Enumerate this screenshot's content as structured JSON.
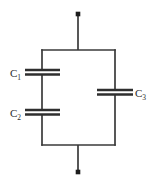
{
  "diagram": {
    "canvas": {
      "width": 156,
      "height": 186,
      "background": "#ffffff"
    },
    "style": {
      "line_color": "#3a3a3a",
      "plate_color": "#2e2e2e",
      "terminal_color": "#1d1d1d",
      "label_color": "#2b2b2b",
      "wire_width": 1.6,
      "plate_width": 2.2
    },
    "terminals": [
      {
        "name": "top-terminal",
        "label": "",
        "x": 78,
        "y": 14,
        "size": 4.6
      },
      {
        "name": "bottom-terminal",
        "label": "",
        "x": 78,
        "y": 172,
        "size": 4.6
      }
    ],
    "leads": [
      {
        "name": "top-lead",
        "x1": 78,
        "y1": 14,
        "x2": 78,
        "y2": 50
      },
      {
        "name": "bottom-lead",
        "x1": 78,
        "y1": 145,
        "x2": 78,
        "y2": 172
      }
    ],
    "loop": {
      "name": "parallel-loop",
      "left": 42,
      "right": 115,
      "top": 50,
      "bottom": 145
    },
    "wires": [
      {
        "name": "top-rail",
        "x1": 42,
        "y1": 50,
        "x2": 115,
        "y2": 50
      },
      {
        "name": "bottom-rail",
        "x1": 42,
        "y1": 145,
        "x2": 115,
        "y2": 145
      },
      {
        "name": "left-rail-upper",
        "x1": 42,
        "y1": 50,
        "x2": 42,
        "y2": 70
      },
      {
        "name": "left-rail-middle",
        "x1": 42,
        "y1": 74,
        "x2": 42,
        "y2": 110
      },
      {
        "name": "left-rail-lower",
        "x1": 42,
        "y1": 114,
        "x2": 42,
        "y2": 145
      },
      {
        "name": "right-rail-upper",
        "x1": 115,
        "y1": 50,
        "x2": 115,
        "y2": 90
      },
      {
        "name": "right-rail-lower",
        "x1": 115,
        "y1": 94,
        "x2": 115,
        "y2": 145
      }
    ],
    "capacitors": [
      {
        "name": "capacitor-c1",
        "label": "C",
        "subscript": "1",
        "branch": "left",
        "orientation": "horizontal-plates",
        "plate_x1": 25,
        "plate_x2": 60,
        "plate_top_y": 70,
        "plate_bottom_y": 74.5,
        "label_x": 10,
        "label_y": 76
      },
      {
        "name": "capacitor-c2",
        "label": "C",
        "subscript": "2",
        "branch": "left",
        "orientation": "horizontal-plates",
        "plate_x1": 25,
        "plate_x2": 60,
        "plate_top_y": 110,
        "plate_bottom_y": 114.5,
        "label_x": 10,
        "label_y": 116
      },
      {
        "name": "capacitor-c3",
        "label": "C",
        "subscript": "3",
        "branch": "right",
        "orientation": "horizontal-plates",
        "plate_x1": 97,
        "plate_x2": 133,
        "plate_top_y": 90,
        "plate_bottom_y": 94.5,
        "label_x": 135,
        "label_y": 97
      }
    ]
  }
}
